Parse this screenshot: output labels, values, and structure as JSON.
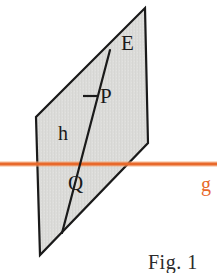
{
  "figure": {
    "caption": "Fig. 1",
    "background_color": "#ffffff"
  },
  "plane": {
    "name": "E",
    "label": "E",
    "fill_color": "#DCDCDA",
    "stroke_color": "#1a1a1a",
    "vertices": [
      {
        "x": 145,
        "y": 8
      },
      {
        "x": 148,
        "y": 143
      },
      {
        "x": 40,
        "y": 255
      },
      {
        "x": 36,
        "y": 117
      }
    ]
  },
  "line_h": {
    "name": "h",
    "label": "h",
    "color": "#1a1a1a",
    "start": {
      "x": 110,
      "y": 50
    },
    "end": {
      "x": 62,
      "y": 233
    }
  },
  "line_g": {
    "name": "g",
    "label": "g",
    "color": "#E8692B",
    "start": {
      "x": 0,
      "y": 164
    },
    "end": {
      "x": 217,
      "y": 164
    }
  },
  "points": [
    {
      "label": "P",
      "x": 90,
      "y": 97,
      "tick": true
    },
    {
      "label": "Q",
      "x": 79,
      "y": 164,
      "tick": false
    }
  ],
  "colors": {
    "plane_fill": "#DCDCDA",
    "ink": "#1a1a1a",
    "accent_orange": "#E8692B"
  }
}
